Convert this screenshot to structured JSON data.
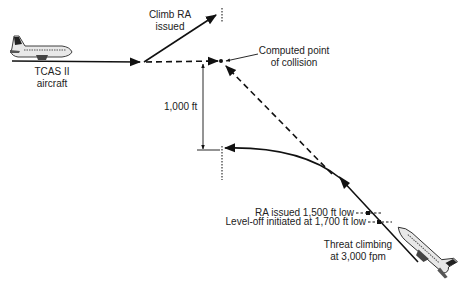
{
  "diagram": {
    "labels": {
      "own_aircraft": [
        "TCAS II",
        "aircraft"
      ],
      "climb_ra": [
        "Climb RA",
        "issued"
      ],
      "collision_point": [
        "Computed point",
        "of collision"
      ],
      "separation": "1,000 ft",
      "ra_issued": "RA issued 1,500 ft low",
      "level_off": "Level-off initiated at 1,700 ft low",
      "threat": [
        "Threat climbing",
        "at 3,000 fpm"
      ]
    },
    "colors": {
      "line": "#111111",
      "text": "#222222",
      "aircraft_fill": "#e8e8e8",
      "background": "#ffffff"
    }
  }
}
